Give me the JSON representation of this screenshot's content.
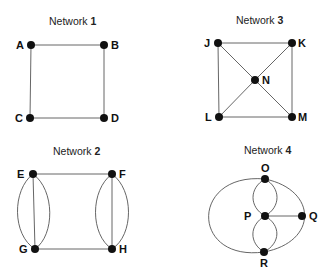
{
  "networks": [
    {
      "id": "network-1",
      "title_prefix": "Network ",
      "title_number": "1",
      "vertices": [
        {
          "label": "A",
          "x": 31,
          "y": 45
        },
        {
          "label": "B",
          "x": 104,
          "y": 45
        },
        {
          "label": "C",
          "x": 30,
          "y": 118
        },
        {
          "label": "D",
          "x": 104,
          "y": 118
        }
      ],
      "edges": [
        [
          "A",
          "B"
        ],
        [
          "B",
          "D"
        ],
        [
          "D",
          "C"
        ],
        [
          "C",
          "A"
        ]
      ]
    },
    {
      "id": "network-3",
      "title_prefix": "Network ",
      "title_number": "3",
      "vertices": [
        {
          "label": "J",
          "x": 218,
          "y": 43
        },
        {
          "label": "K",
          "x": 292,
          "y": 43
        },
        {
          "label": "N",
          "x": 255,
          "y": 80
        },
        {
          "label": "L",
          "x": 219,
          "y": 117
        },
        {
          "label": "M",
          "x": 292,
          "y": 117
        }
      ],
      "edges": [
        [
          "J",
          "K"
        ],
        [
          "K",
          "M"
        ],
        [
          "M",
          "L"
        ],
        [
          "L",
          "J"
        ],
        [
          "J",
          "N"
        ],
        [
          "N",
          "M"
        ],
        [
          "K",
          "N"
        ],
        [
          "N",
          "L"
        ]
      ]
    },
    {
      "id": "network-2",
      "title_prefix": "Network ",
      "title_number": "2",
      "vertices": [
        {
          "label": "E",
          "x": 33,
          "y": 174
        },
        {
          "label": "F",
          "x": 112,
          "y": 174
        },
        {
          "label": "G",
          "x": 35,
          "y": 249
        },
        {
          "label": "H",
          "x": 112,
          "y": 249
        }
      ],
      "edges": [
        [
          "E",
          "F"
        ],
        [
          "G",
          "H"
        ],
        [
          "E",
          "G"
        ],
        [
          "E",
          "G"
        ],
        [
          "E",
          "G"
        ],
        [
          "F",
          "H"
        ],
        [
          "F",
          "H"
        ],
        [
          "F",
          "H"
        ]
      ]
    },
    {
      "id": "network-4",
      "title_prefix": "Network ",
      "title_number": "4",
      "vertices": [
        {
          "label": "O",
          "x": 265,
          "y": 179
        },
        {
          "label": "P",
          "x": 265,
          "y": 216
        },
        {
          "label": "Q",
          "x": 302,
          "y": 216
        },
        {
          "label": "R",
          "x": 264,
          "y": 252
        }
      ],
      "edges": [
        [
          "O",
          "P"
        ],
        [
          "O",
          "P"
        ],
        [
          "P",
          "R"
        ],
        [
          "P",
          "R"
        ],
        [
          "P",
          "Q"
        ],
        [
          "O",
          "R"
        ],
        [
          "O",
          "R"
        ]
      ]
    }
  ],
  "colors": {
    "background": "#ffffff",
    "edge": "#555555",
    "node": "#111111",
    "text": "#222222"
  }
}
